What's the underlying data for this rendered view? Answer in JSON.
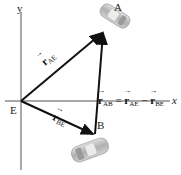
{
  "axes": {
    "x_label": "x",
    "y_label": "y",
    "origin_label": "E"
  },
  "points": {
    "a_label": "A",
    "b_label": "B"
  },
  "vectors": {
    "r_ae": {
      "symbol": "r",
      "subscript": "AE"
    },
    "r_be": {
      "symbol": "r",
      "subscript": "BE"
    },
    "r_ab": {
      "symbol": "r",
      "subscript": "AB"
    }
  },
  "equation": {
    "lhs": {
      "symbol": "r",
      "subscript": "AB"
    },
    "equals": "=",
    "term1": {
      "symbol": "r",
      "subscript": "AE"
    },
    "minus": "−",
    "term2": {
      "symbol": "r",
      "subscript": "BE"
    }
  },
  "colors": {
    "axis": "#555555",
    "vector": "#111111",
    "car": "#bdbdbd"
  }
}
